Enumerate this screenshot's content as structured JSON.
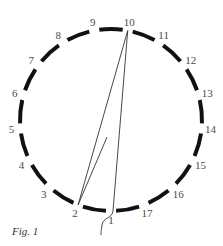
{
  "figure": {
    "caption": "Fig. 1",
    "circle": {
      "cx": 111,
      "cy": 120,
      "r": 91,
      "stroke": "#111111",
      "stroke_width": 4
    },
    "points": [
      {
        "n": "1"
      },
      {
        "n": "2"
      },
      {
        "n": "3"
      },
      {
        "n": "4"
      },
      {
        "n": "5"
      },
      {
        "n": "6"
      },
      {
        "n": "7"
      },
      {
        "n": "8"
      },
      {
        "n": "9"
      },
      {
        "n": "10"
      },
      {
        "n": "11"
      },
      {
        "n": "12"
      },
      {
        "n": "13"
      },
      {
        "n": "14"
      },
      {
        "n": "15"
      },
      {
        "n": "16"
      },
      {
        "n": "17"
      }
    ],
    "threads": [
      {
        "from": "10",
        "to": "2"
      },
      {
        "from": "10",
        "to": "1"
      },
      {
        "from": "2",
        "to": "mid",
        "end": [
          107,
          137
        ]
      }
    ],
    "thread_color": "#333333"
  }
}
